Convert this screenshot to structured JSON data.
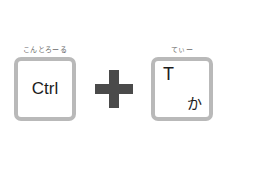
{
  "keys": [
    {
      "ruby": "こんとろーる",
      "label": "Ctrl"
    },
    {
      "ruby": "てぃー",
      "label": "T",
      "kana": "か"
    }
  ],
  "operator": "plus",
  "colors": {
    "key_border": "#b9b9b9",
    "plus": "#4a4a4a",
    "text": "#1c1c1c",
    "ruby": "#6a6a6a"
  }
}
